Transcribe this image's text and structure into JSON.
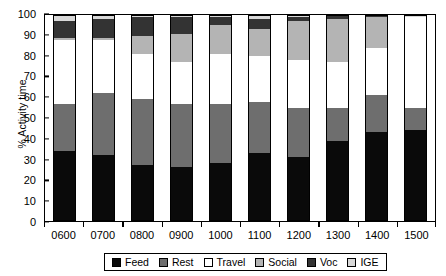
{
  "chart_data": {
    "type": "bar",
    "subtype": "stacked-bar-100",
    "title": "",
    "xlabel": "",
    "ylabel": "% Activity time",
    "ylim": [
      0,
      100
    ],
    "yticks": [
      0,
      10,
      20,
      30,
      40,
      50,
      60,
      70,
      80,
      90,
      100
    ],
    "grid": false,
    "legend_position": "bottom-center",
    "categories": [
      "0600",
      "0700",
      "0800",
      "0900",
      "1000",
      "1100",
      "1200",
      "1300",
      "1400",
      "1500"
    ],
    "series": [
      {
        "name": "Feed",
        "color": "#0a0a0a",
        "values": [
          34,
          32,
          27,
          26,
          28,
          33,
          31,
          39,
          43,
          44
        ]
      },
      {
        "name": "Rest",
        "color": "#6e6e6e",
        "values": [
          23,
          30,
          32,
          31,
          29,
          25,
          24,
          16,
          18,
          11
        ]
      },
      {
        "name": "Travel",
        "color": "#ffffff",
        "values": [
          31,
          26,
          22,
          20,
          24,
          22,
          23,
          22,
          23,
          44
        ]
      },
      {
        "name": "Social",
        "color": "#b4b4b4",
        "values": [
          1,
          1,
          9,
          14,
          14,
          13,
          19,
          21,
          15,
          0
        ]
      },
      {
        "name": "Voc",
        "color": "#333333",
        "values": [
          8,
          9,
          9,
          8,
          4,
          5,
          2,
          2,
          1,
          0
        ]
      },
      {
        "name": "IGE",
        "color": "#d8d8d8",
        "values": [
          3,
          2,
          1,
          1,
          1,
          2,
          1,
          0,
          0,
          1
        ]
      }
    ]
  },
  "legend": {
    "items": [
      {
        "label": "Feed",
        "swatch": "#0a0a0a"
      },
      {
        "label": "Rest",
        "swatch": "#6e6e6e"
      },
      {
        "label": "Travel",
        "swatch": "#ffffff"
      },
      {
        "label": "Social",
        "swatch": "#b4b4b4"
      },
      {
        "label": "Voc",
        "swatch": "#333333"
      },
      {
        "label": "IGE",
        "swatch": "#d8d8d8"
      }
    ]
  }
}
